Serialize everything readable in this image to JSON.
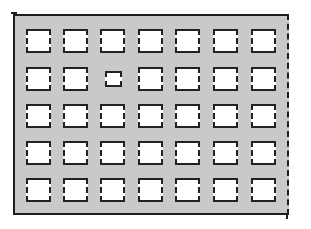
{
  "diagram": {
    "type": "grid-of-squares",
    "style": "hand-drawn sketch",
    "colors": {
      "fill": "#c9c9c9",
      "stroke": "#1e1e1e",
      "square": "#ffffff"
    },
    "columns": 7,
    "rows": 5,
    "cells": [
      [
        "normal",
        "normal",
        "normal",
        "normal",
        "normal",
        "normal",
        "normal"
      ],
      [
        "normal",
        "normal",
        "small",
        "normal",
        "normal",
        "normal",
        "normal"
      ],
      [
        "normal",
        "normal",
        "normal",
        "normal",
        "normal",
        "normal",
        "normal"
      ],
      [
        "normal",
        "normal",
        "normal",
        "normal",
        "normal",
        "normal",
        "normal"
      ],
      [
        "normal",
        "normal",
        "normal",
        "normal",
        "normal",
        "normal",
        "normal"
      ]
    ]
  }
}
